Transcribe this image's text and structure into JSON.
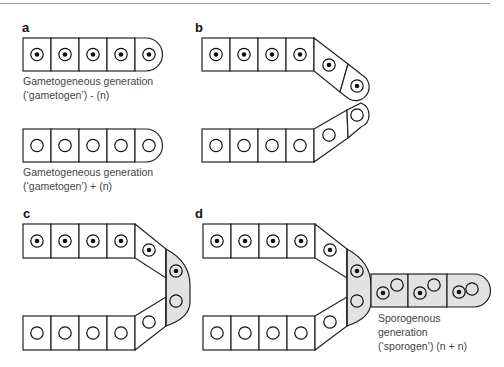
{
  "figure": {
    "panels": [
      {
        "id": "a",
        "label": "a",
        "captions": [
          {
            "lines": [
              "Gametogeneous generation",
              "(‘gametogen’) - (n)"
            ]
          },
          {
            "lines": [
              "Gametogeneous generation",
              "(‘gametogen’) + (n)"
            ]
          }
        ],
        "description": "Two separate filaments of 5 cells each; top filament with dotted nuclei (- strain), bottom with empty nuclei (+ strain)"
      },
      {
        "id": "b",
        "label": "b",
        "description": "Two filaments bending toward each other; tips approaching"
      },
      {
        "id": "c",
        "label": "c",
        "description": "Tip cells fused into a shared gray zygote-like cell containing one dotted and one empty nucleus"
      },
      {
        "id": "d",
        "label": "d",
        "captions": [
          {
            "lines": [
              "Sporogenous",
              "generation",
              "(‘sporogen’) (n + n)"
            ]
          }
        ],
        "description": "Fused cell gives rise to a sporogen filament of 3 gray cells, each with one dotted and one empty nucleus"
      }
    ],
    "legend": {
      "dotted_nucleus": "(n) - nucleus",
      "empty_nucleus": "(n) + nucleus",
      "gray_fill": "#e2e2e2"
    }
  }
}
